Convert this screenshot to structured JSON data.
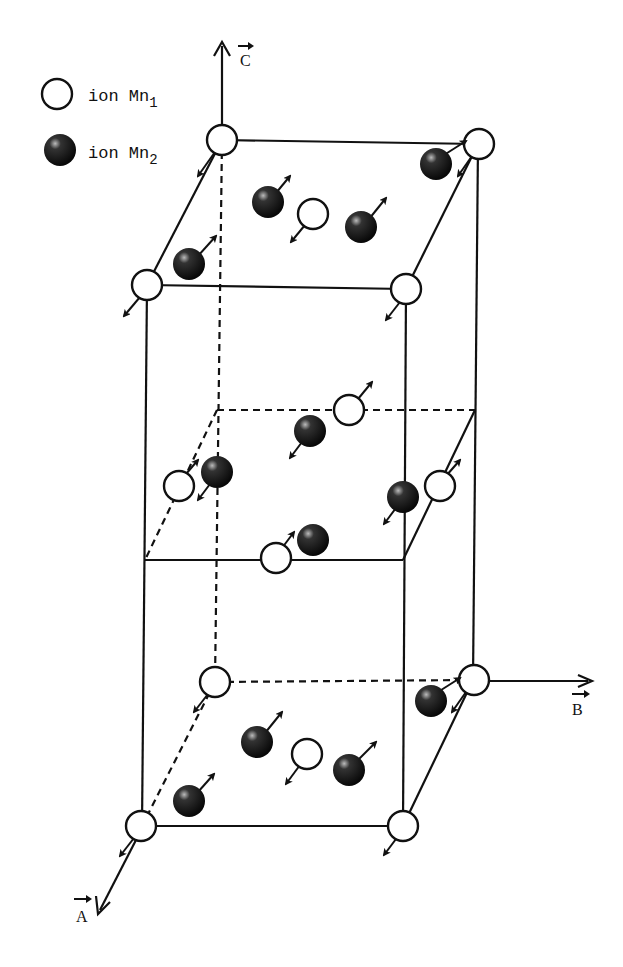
{
  "legend": {
    "items": [
      {
        "symbol": "open-circle",
        "label": "ion Mn",
        "subscript": "1"
      },
      {
        "symbol": "filled-sphere",
        "label": "ion Mn",
        "subscript": "2"
      }
    ]
  },
  "axes": {
    "c": {
      "label": "C",
      "vector": true
    },
    "b": {
      "label": "B",
      "vector": true
    },
    "a": {
      "label": "A",
      "vector": true
    }
  },
  "structure": {
    "description": "Magnetic unit cell with Mn1 and Mn2 ion spin orientations",
    "mn1_count_visible": 16,
    "mn2_count_visible": 14
  }
}
